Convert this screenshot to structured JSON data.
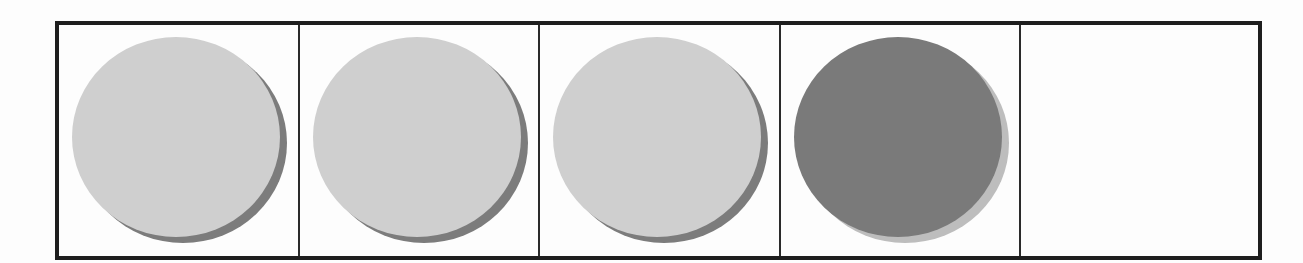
{
  "figure": {
    "border_color": "#1e1e1e",
    "cells": [
      {
        "index": 1,
        "content": "circle",
        "fill": "#cfcfcf",
        "shadow": "#7c7c7c",
        "width": 241
      },
      {
        "index": 2,
        "content": "circle",
        "fill": "#cfcfcf",
        "shadow": "#7c7c7c",
        "width": 240
      },
      {
        "index": 3,
        "content": "circle",
        "fill": "#cfcfcf",
        "shadow": "#7c7c7c",
        "width": 241
      },
      {
        "index": 4,
        "content": "circle",
        "fill": "#7a7a7a",
        "shadow": "#bdbdbd",
        "width": 240
      },
      {
        "index": 5,
        "content": "empty",
        "width": 237
      }
    ]
  }
}
